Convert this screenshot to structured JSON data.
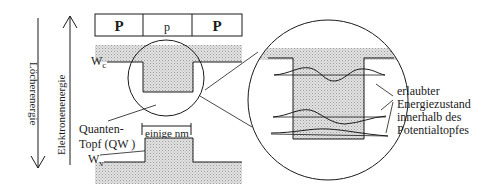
{
  "axes": {
    "hole_energy_label": "Löcherenergie",
    "electron_energy_label": "Elektronenenergie"
  },
  "layers": [
    {
      "label": "P"
    },
    {
      "label": "p"
    },
    {
      "label": "P"
    }
  ],
  "bands": {
    "conduction_label": "W",
    "conduction_subscript": "c",
    "valence_label": "W",
    "valence_subscript": "v"
  },
  "quantum_well": {
    "label_line1": "Quanten-",
    "label_line2": "Topf (QW )",
    "width_label": "einige nm"
  },
  "states_annotation": {
    "line1": "erlaubter",
    "line2": "Energiezustand",
    "line3": "innerhalb des",
    "line4": "Potentialtopfes"
  },
  "colors": {
    "line": "#1a1a1a",
    "shade": "#d4d4d4"
  }
}
